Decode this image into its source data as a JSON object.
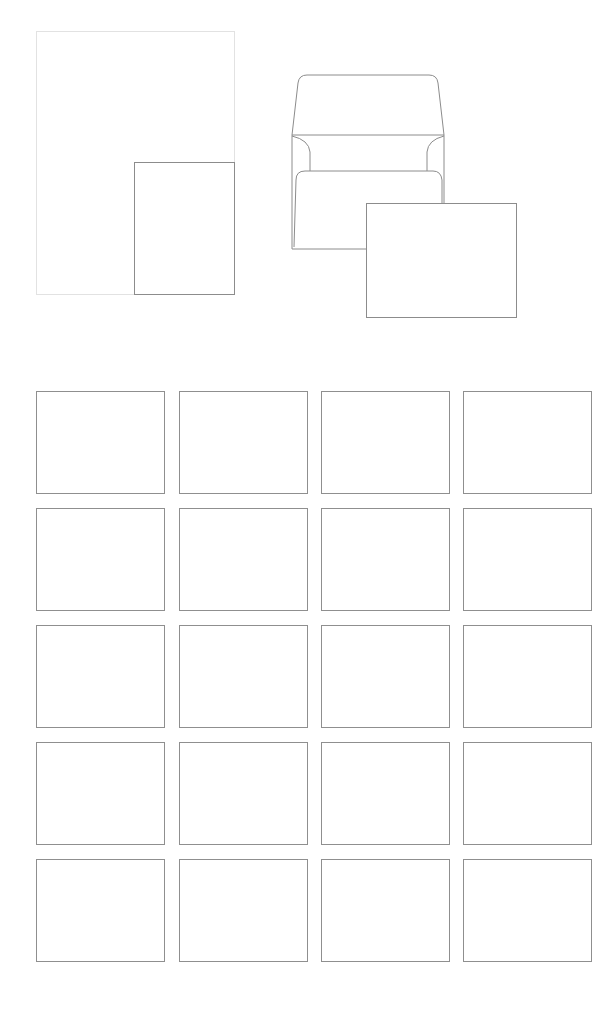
{
  "figure": {
    "colors": {
      "background": "#ffffff",
      "sheet_border": "#e2e2e2",
      "line": "#8c8c8c"
    },
    "sheet": {
      "label": "",
      "x": 36,
      "y": 31,
      "w": 199,
      "h": 264
    },
    "sheet_card": {
      "label": "",
      "x": 134,
      "y": 162,
      "w": 101,
      "h": 133
    },
    "envelope": {
      "label": "",
      "x": 292,
      "y": 75,
      "w": 152,
      "h": 174
    },
    "envelope_card": {
      "label": "",
      "x": 366,
      "y": 203,
      "w": 151,
      "h": 115
    },
    "grid": {
      "columns": 4,
      "rows": 5,
      "col_x": [
        36,
        179,
        321,
        463
      ],
      "row_y": [
        391,
        508,
        625,
        742,
        859
      ],
      "card_w": 129,
      "card_h": 103
    }
  }
}
